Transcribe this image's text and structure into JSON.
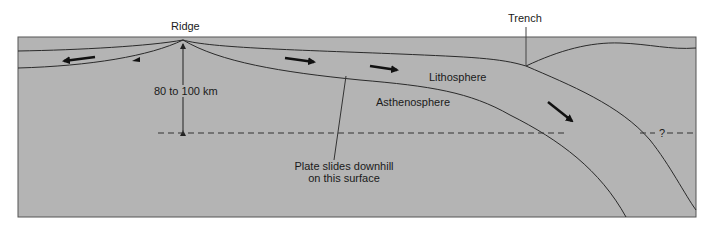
{
  "diagram": {
    "colors": {
      "background": "#ffffff",
      "panel": "#b4b4b4",
      "panel_border": "#555555",
      "line": "#2a2a2a",
      "arrow": "#111111",
      "text": "#1a1a1a"
    },
    "labels": {
      "ridge": "Ridge",
      "trench": "Trench",
      "thickness": "80 to 100 km",
      "lithosphere": "Lithosphere",
      "asthenosphere": "Asthenosphere",
      "plate_slides_line1": "Plate slides downhill",
      "plate_slides_line2": "on this surface",
      "question_mark": "?"
    },
    "arrows": [
      {
        "name": "left-plate-motion-arrow",
        "direction": "left"
      },
      {
        "name": "left-lower-arrowhead",
        "direction": "left"
      },
      {
        "name": "right-plate-motion-arrow-1",
        "direction": "right"
      },
      {
        "name": "right-plate-motion-arrow-2",
        "direction": "right"
      },
      {
        "name": "subduction-arrow",
        "direction": "down-right"
      }
    ]
  }
}
